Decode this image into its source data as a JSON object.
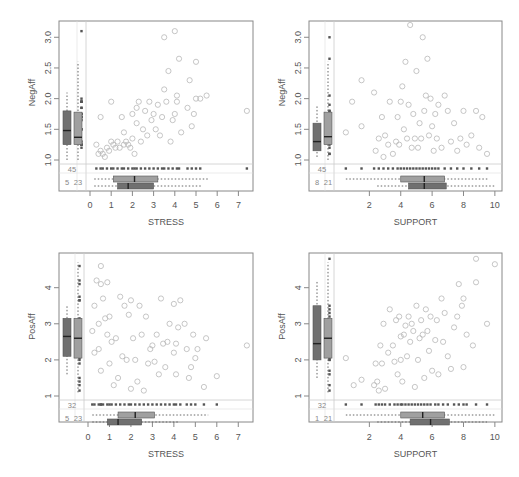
{
  "chart_data": [
    {
      "type": "scatter",
      "panel": "top-left",
      "xlabel": "STRESS",
      "ylabel": "NegAff",
      "xticks": [
        "0",
        "1",
        "2",
        "3",
        "4",
        "5",
        "6",
        "7"
      ],
      "yticks": [
        "1.0",
        "1.5",
        "2.0",
        "2.5",
        "3.0"
      ],
      "xlim": [
        0,
        7.5
      ],
      "ylim": [
        1.0,
        3.2
      ],
      "missing_counts": {
        "y_missing": "45",
        "x_missing": "23",
        "both_missing": "5"
      },
      "marginal_boxplots": {
        "y_observed": {
          "q1": 1.25,
          "median": 1.48,
          "q3": 1.8,
          "whisker_low": 1.0,
          "whisker_high": 2.1
        },
        "y_x_missing": {
          "q1": 1.25,
          "median": 1.37,
          "q3": 1.78,
          "whisker_low": 1.0,
          "whisker_high": 2.6
        },
        "x_observed": {
          "q1": 1.1,
          "median": 2.1,
          "q3": 3.2,
          "whisker_low": 0.2,
          "whisker_high": 5.6
        },
        "x_y_missing": {
          "q1": 1.3,
          "median": 1.8,
          "q3": 3.0,
          "whisker_low": 0.2,
          "whisker_high": 5.3
        }
      },
      "points": [
        [
          0.3,
          1.25
        ],
        [
          0.4,
          1.1
        ],
        [
          0.5,
          1.15
        ],
        [
          0.5,
          1.7
        ],
        [
          0.6,
          1.1
        ],
        [
          0.7,
          1.05
        ],
        [
          0.8,
          1.2
        ],
        [
          0.9,
          1.15
        ],
        [
          1.0,
          1.3
        ],
        [
          1.0,
          1.95
        ],
        [
          1.1,
          1.25
        ],
        [
          1.2,
          1.2
        ],
        [
          1.3,
          1.3
        ],
        [
          1.4,
          1.2
        ],
        [
          1.5,
          1.7
        ],
        [
          1.6,
          1.25
        ],
        [
          1.6,
          1.45
        ],
        [
          1.7,
          1.3
        ],
        [
          1.8,
          1.25
        ],
        [
          1.9,
          1.2
        ],
        [
          2.0,
          1.35
        ],
        [
          2.0,
          1.75
        ],
        [
          2.1,
          1.1
        ],
        [
          2.2,
          1.6
        ],
        [
          2.2,
          1.85
        ],
        [
          2.3,
          1.95
        ],
        [
          2.4,
          1.3
        ],
        [
          2.5,
          1.5
        ],
        [
          2.6,
          1.8
        ],
        [
          2.7,
          1.4
        ],
        [
          2.8,
          1.95
        ],
        [
          2.9,
          1.65
        ],
        [
          3.0,
          1.75
        ],
        [
          3.1,
          1.5
        ],
        [
          3.2,
          1.9
        ],
        [
          3.3,
          1.4
        ],
        [
          3.4,
          1.7
        ],
        [
          3.5,
          2.15
        ],
        [
          3.5,
          3.0
        ],
        [
          3.6,
          1.95
        ],
        [
          3.7,
          2.45
        ],
        [
          3.8,
          1.3
        ],
        [
          3.9,
          1.65
        ],
        [
          4.0,
          1.75
        ],
        [
          4.1,
          2.05
        ],
        [
          4.1,
          1.95
        ],
        [
          4.2,
          2.65
        ],
        [
          4.3,
          1.45
        ],
        [
          4.6,
          1.85
        ],
        [
          4.7,
          2.3
        ],
        [
          4.8,
          1.55
        ],
        [
          4.9,
          1.75
        ],
        [
          5.0,
          2.0
        ],
        [
          5.0,
          2.6
        ],
        [
          5.2,
          2.0
        ],
        [
          5.5,
          2.05
        ],
        [
          7.4,
          1.8
        ],
        [
          4.0,
          3.1
        ]
      ]
    },
    {
      "type": "scatter",
      "panel": "top-right",
      "xlabel": "SUPPORT",
      "ylabel": "NegAff",
      "xticks": [
        "2",
        "4",
        "6",
        "8",
        "10"
      ],
      "yticks": [
        "1.0",
        "1.5",
        "2.0",
        "2.5",
        "3.0"
      ],
      "xlim": [
        0,
        10.2
      ],
      "ylim": [
        1.0,
        3.2
      ],
      "missing_counts": {
        "y_missing": "45",
        "x_missing": "21",
        "both_missing": "8"
      },
      "marginal_boxplots": {
        "y_observed": {
          "q1": 1.15,
          "median": 1.3,
          "q3": 1.6,
          "whisker_low": 1.05,
          "whisker_high": 1.9
        },
        "y_x_missing": {
          "q1": 1.25,
          "median": 1.38,
          "q3": 1.78,
          "whisker_low": 1.0,
          "whisker_high": 2.6
        },
        "x_observed": {
          "q1": 4.0,
          "median": 5.5,
          "q3": 6.8,
          "whisker_low": 0.5,
          "whisker_high": 9.6
        },
        "x_y_missing": {
          "q1": 4.5,
          "median": 5.5,
          "q3": 6.9,
          "whisker_low": 2.5,
          "whisker_high": 10.0
        }
      },
      "points": [
        [
          0.5,
          1.45
        ],
        [
          0.9,
          1.95
        ],
        [
          1.5,
          2.3
        ],
        [
          1.5,
          1.55
        ],
        [
          2.3,
          2.1
        ],
        [
          2.4,
          1.15
        ],
        [
          2.6,
          1.35
        ],
        [
          2.8,
          1.7
        ],
        [
          2.9,
          1.05
        ],
        [
          3.0,
          1.4
        ],
        [
          3.2,
          1.25
        ],
        [
          3.3,
          1.95
        ],
        [
          3.5,
          1.1
        ],
        [
          3.7,
          1.3
        ],
        [
          3.8,
          1.7
        ],
        [
          3.9,
          1.25
        ],
        [
          4.0,
          1.95
        ],
        [
          4.1,
          2.2
        ],
        [
          4.2,
          1.5
        ],
        [
          4.3,
          2.6
        ],
        [
          4.4,
          1.35
        ],
        [
          4.5,
          1.9
        ],
        [
          4.6,
          3.2
        ],
        [
          4.7,
          1.2
        ],
        [
          4.8,
          1.75
        ],
        [
          4.9,
          1.35
        ],
        [
          5.0,
          2.45
        ],
        [
          5.1,
          1.2
        ],
        [
          5.2,
          1.6
        ],
        [
          5.3,
          1.35
        ],
        [
          5.4,
          3.0
        ],
        [
          5.5,
          1.8
        ],
        [
          5.6,
          2.05
        ],
        [
          5.7,
          2.65
        ],
        [
          5.8,
          1.4
        ],
        [
          5.9,
          2.0
        ],
        [
          6.0,
          1.55
        ],
        [
          6.1,
          1.15
        ],
        [
          6.2,
          1.75
        ],
        [
          6.3,
          1.35
        ],
        [
          6.4,
          1.9
        ],
        [
          6.6,
          1.2
        ],
        [
          6.8,
          2.05
        ],
        [
          7.0,
          1.8
        ],
        [
          7.2,
          1.3
        ],
        [
          7.4,
          1.6
        ],
        [
          7.6,
          1.15
        ],
        [
          7.8,
          1.35
        ],
        [
          8.0,
          1.8
        ],
        [
          8.2,
          1.25
        ],
        [
          8.5,
          1.4
        ],
        [
          8.8,
          1.8
        ],
        [
          9.0,
          1.2
        ],
        [
          9.2,
          1.7
        ],
        [
          9.5,
          1.1
        ]
      ]
    },
    {
      "type": "scatter",
      "panel": "bottom-left",
      "xlabel": "STRESS",
      "ylabel": "PosAff",
      "xticks": [
        "0",
        "1",
        "2",
        "3",
        "4",
        "5",
        "6",
        "7"
      ],
      "yticks": [
        "1",
        "2",
        "3",
        "4"
      ],
      "xlim": [
        0,
        7.5
      ],
      "ylim": [
        1.0,
        4.85
      ],
      "missing_counts": {
        "y_missing": "32",
        "x_missing": "23",
        "both_missing": "5"
      },
      "marginal_boxplots": {
        "y_observed": {
          "q1": 2.1,
          "median": 2.65,
          "q3": 3.15,
          "whisker_low": 1.6,
          "whisker_high": 3.5
        },
        "y_x_missing": {
          "q1": 2.05,
          "median": 2.6,
          "q3": 3.15,
          "whisker_low": 1.1,
          "whisker_high": 4.7
        },
        "x_observed": {
          "q1": 1.4,
          "median": 2.2,
          "q3": 3.1,
          "whisker_low": 0.2,
          "whisker_high": 5.6
        },
        "x_y_missing": {
          "q1": 0.9,
          "median": 1.4,
          "q3": 2.5,
          "whisker_low": 0.2,
          "whisker_high": 4.2
        }
      },
      "points": [
        [
          0.2,
          2.8
        ],
        [
          0.3,
          3.5
        ],
        [
          0.3,
          2.2
        ],
        [
          0.4,
          4.2
        ],
        [
          0.5,
          2.3
        ],
        [
          0.5,
          3.0
        ],
        [
          0.6,
          4.1
        ],
        [
          0.6,
          1.7
        ],
        [
          0.7,
          3.7
        ],
        [
          0.8,
          3.15
        ],
        [
          0.9,
          2.7
        ],
        [
          0.9,
          4.15
        ],
        [
          1.0,
          1.9
        ],
        [
          1.0,
          3.2
        ],
        [
          1.1,
          2.5
        ],
        [
          1.2,
          1.3
        ],
        [
          1.3,
          2.6
        ],
        [
          1.4,
          1.5
        ],
        [
          1.5,
          3.75
        ],
        [
          1.6,
          2.1
        ],
        [
          1.7,
          3.5
        ],
        [
          1.8,
          2.0
        ],
        [
          1.9,
          3.25
        ],
        [
          2.0,
          1.2
        ],
        [
          2.0,
          3.65
        ],
        [
          2.1,
          2.6
        ],
        [
          2.2,
          2.0
        ],
        [
          2.3,
          1.4
        ],
        [
          2.4,
          3.5
        ],
        [
          2.5,
          2.7
        ],
        [
          2.6,
          1.15
        ],
        [
          2.7,
          3.2
        ],
        [
          2.8,
          1.9
        ],
        [
          2.9,
          2.3
        ],
        [
          3.0,
          2.4
        ],
        [
          3.1,
          1.95
        ],
        [
          3.2,
          2.7
        ],
        [
          3.3,
          1.6
        ],
        [
          3.4,
          3.7
        ],
        [
          3.5,
          2.45
        ],
        [
          3.6,
          1.8
        ],
        [
          3.7,
          2.5
        ],
        [
          3.8,
          3.0
        ],
        [
          4.0,
          2.2
        ],
        [
          4.0,
          3.55
        ],
        [
          4.1,
          2.45
        ],
        [
          4.1,
          1.6
        ],
        [
          4.2,
          2.9
        ],
        [
          4.3,
          3.65
        ],
        [
          4.5,
          3.0
        ],
        [
          4.6,
          2.3
        ],
        [
          4.7,
          1.5
        ],
        [
          4.8,
          1.8
        ],
        [
          4.9,
          2.7
        ],
        [
          5.0,
          2.05
        ],
        [
          5.1,
          2.3
        ],
        [
          5.4,
          1.25
        ],
        [
          5.5,
          2.6
        ],
        [
          6.0,
          1.55
        ],
        [
          7.4,
          2.4
        ],
        [
          0.6,
          4.6
        ]
      ]
    },
    {
      "type": "scatter",
      "panel": "bottom-right",
      "xlabel": "SUPPORT",
      "ylabel": "PosAff",
      "xticks": [
        "2",
        "4",
        "6",
        "8",
        "10"
      ],
      "yticks": [
        "1",
        "2",
        "3",
        "4"
      ],
      "xlim": [
        0,
        10.2
      ],
      "ylim": [
        1.0,
        4.85
      ],
      "missing_counts": {
        "y_missing": "32",
        "x_missing": "21",
        "both_missing": "1"
      },
      "marginal_boxplots": {
        "y_observed": {
          "q1": 2.0,
          "median": 2.45,
          "q3": 3.5,
          "whisker_low": 1.5,
          "whisker_high": 4.2
        },
        "y_x_missing": {
          "q1": 2.05,
          "median": 2.6,
          "q3": 3.15,
          "whisker_low": 1.1,
          "whisker_high": 4.7
        },
        "x_observed": {
          "q1": 4.0,
          "median": 5.4,
          "q3": 6.8,
          "whisker_low": 0.5,
          "whisker_high": 10.0
        },
        "x_y_missing": {
          "q1": 4.6,
          "median": 5.9,
          "q3": 7.1,
          "whisker_low": 2.5,
          "whisker_high": 9.5
        }
      },
      "points": [
        [
          0.5,
          2.05
        ],
        [
          1.0,
          1.3
        ],
        [
          1.5,
          1.45
        ],
        [
          2.3,
          1.3
        ],
        [
          2.4,
          1.9
        ],
        [
          2.5,
          1.4
        ],
        [
          2.6,
          1.15
        ],
        [
          2.7,
          2.4
        ],
        [
          2.8,
          1.9
        ],
        [
          2.9,
          3.0
        ],
        [
          3.0,
          1.2
        ],
        [
          3.2,
          2.2
        ],
        [
          3.3,
          3.4
        ],
        [
          3.5,
          2.4
        ],
        [
          3.6,
          1.95
        ],
        [
          3.7,
          3.1
        ],
        [
          3.8,
          1.6
        ],
        [
          3.9,
          3.2
        ],
        [
          4.0,
          2.0
        ],
        [
          4.0,
          2.65
        ],
        [
          4.1,
          1.4
        ],
        [
          4.2,
          2.7
        ],
        [
          4.3,
          2.95
        ],
        [
          4.4,
          2.1
        ],
        [
          4.5,
          3.2
        ],
        [
          4.6,
          2.5
        ],
        [
          4.7,
          3.0
        ],
        [
          4.8,
          2.8
        ],
        [
          4.9,
          1.25
        ],
        [
          5.0,
          3.5
        ],
        [
          5.1,
          2.0
        ],
        [
          5.2,
          2.6
        ],
        [
          5.3,
          3.1
        ],
        [
          5.4,
          2.7
        ],
        [
          5.5,
          1.5
        ],
        [
          5.6,
          3.4
        ],
        [
          5.7,
          2.8
        ],
        [
          5.8,
          2.25
        ],
        [
          5.9,
          3.2
        ],
        [
          6.0,
          1.7
        ],
        [
          6.2,
          2.55
        ],
        [
          6.3,
          3.1
        ],
        [
          6.4,
          1.6
        ],
        [
          6.6,
          3.7
        ],
        [
          6.7,
          2.5
        ],
        [
          6.8,
          3.3
        ],
        [
          7.0,
          2.1
        ],
        [
          7.2,
          1.75
        ],
        [
          7.4,
          2.9
        ],
        [
          7.6,
          3.2
        ],
        [
          7.7,
          4.1
        ],
        [
          7.9,
          3.5
        ],
        [
          8.0,
          3.7
        ],
        [
          8.0,
          1.8
        ],
        [
          8.2,
          2.7
        ],
        [
          8.6,
          2.4
        ],
        [
          8.8,
          4.15
        ],
        [
          8.8,
          4.8
        ],
        [
          9.5,
          3.0
        ],
        [
          10.0,
          4.65
        ]
      ]
    }
  ],
  "panels": [
    {
      "xlabel": "STRESS",
      "ylabel": "NegAff"
    },
    {
      "xlabel": "SUPPORT",
      "ylabel": "NegAff"
    },
    {
      "xlabel": "STRESS",
      "ylabel": "PosAff"
    },
    {
      "xlabel": "SUPPORT",
      "ylabel": "PosAff"
    }
  ],
  "colors": {
    "point_observed": "#b8b8b8",
    "point_missing": "#555555",
    "box_dark": "#707070",
    "box_light": "#a0a0a0",
    "frame": "#888888",
    "axis_text": "#555555"
  }
}
